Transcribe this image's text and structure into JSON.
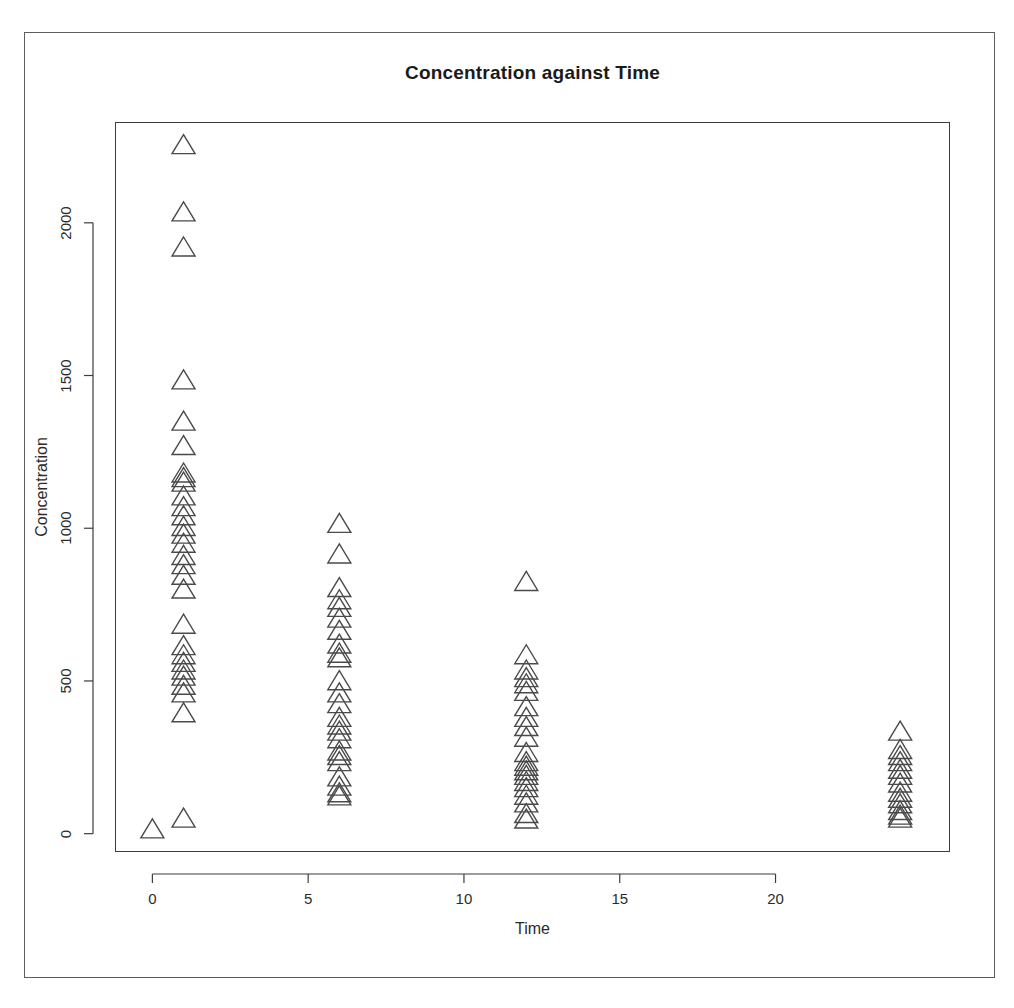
{
  "figure": {
    "title": "Concentration against Time",
    "background_color": "#ffffff",
    "frame_color": "#5d5d5d",
    "axis_color": "#3c3c3c",
    "marker_color": "#4a4a4a"
  },
  "axes": {
    "x_label": "Time",
    "y_label": "Concentration",
    "x_ticks": [
      "0",
      "5",
      "10",
      "15",
      "20"
    ],
    "y_ticks": [
      "0",
      "500",
      "1000",
      "1500",
      "2000"
    ]
  },
  "chart_data": {
    "type": "scatter",
    "title": "Concentration against Time",
    "xlabel": "Time",
    "ylabel": "Concentration",
    "marker": "open-triangle",
    "grid": false,
    "legend": null,
    "xlim": [
      -1.2,
      25.6
    ],
    "ylim": [
      -60,
      2330
    ],
    "x_ticks": [
      0,
      5,
      10,
      15,
      20
    ],
    "y_ticks": [
      0,
      500,
      1000,
      1500,
      2000
    ],
    "points": [
      {
        "x": 0,
        "y": 10
      },
      {
        "x": 1,
        "y": 45
      },
      {
        "x": 1,
        "y": 2250
      },
      {
        "x": 1,
        "y": 2030
      },
      {
        "x": 1,
        "y": 1915
      },
      {
        "x": 1,
        "y": 1480
      },
      {
        "x": 1,
        "y": 1345
      },
      {
        "x": 1,
        "y": 1265
      },
      {
        "x": 1,
        "y": 1175
      },
      {
        "x": 1,
        "y": 1160
      },
      {
        "x": 1,
        "y": 1145
      },
      {
        "x": 1,
        "y": 1100
      },
      {
        "x": 1,
        "y": 1065
      },
      {
        "x": 1,
        "y": 1035
      },
      {
        "x": 1,
        "y": 1000
      },
      {
        "x": 1,
        "y": 975
      },
      {
        "x": 1,
        "y": 945
      },
      {
        "x": 1,
        "y": 905
      },
      {
        "x": 1,
        "y": 875
      },
      {
        "x": 1,
        "y": 840
      },
      {
        "x": 1,
        "y": 795
      },
      {
        "x": 1,
        "y": 680
      },
      {
        "x": 1,
        "y": 610
      },
      {
        "x": 1,
        "y": 580
      },
      {
        "x": 1,
        "y": 555
      },
      {
        "x": 1,
        "y": 530
      },
      {
        "x": 1,
        "y": 510
      },
      {
        "x": 1,
        "y": 480
      },
      {
        "x": 1,
        "y": 455
      },
      {
        "x": 1,
        "y": 390
      },
      {
        "x": 6,
        "y": 1010
      },
      {
        "x": 6,
        "y": 910
      },
      {
        "x": 6,
        "y": 800
      },
      {
        "x": 6,
        "y": 760
      },
      {
        "x": 6,
        "y": 735
      },
      {
        "x": 6,
        "y": 700
      },
      {
        "x": 6,
        "y": 660
      },
      {
        "x": 6,
        "y": 615
      },
      {
        "x": 6,
        "y": 585
      },
      {
        "x": 6,
        "y": 570
      },
      {
        "x": 6,
        "y": 495
      },
      {
        "x": 6,
        "y": 455
      },
      {
        "x": 6,
        "y": 420
      },
      {
        "x": 6,
        "y": 375
      },
      {
        "x": 6,
        "y": 350
      },
      {
        "x": 6,
        "y": 330
      },
      {
        "x": 6,
        "y": 305
      },
      {
        "x": 6,
        "y": 265
      },
      {
        "x": 6,
        "y": 250
      },
      {
        "x": 6,
        "y": 230
      },
      {
        "x": 6,
        "y": 180
      },
      {
        "x": 6,
        "y": 150
      },
      {
        "x": 6,
        "y": 128
      },
      {
        "x": 6,
        "y": 118
      },
      {
        "x": 12,
        "y": 820
      },
      {
        "x": 12,
        "y": 580
      },
      {
        "x": 12,
        "y": 530
      },
      {
        "x": 12,
        "y": 505
      },
      {
        "x": 12,
        "y": 485
      },
      {
        "x": 12,
        "y": 460
      },
      {
        "x": 12,
        "y": 410
      },
      {
        "x": 12,
        "y": 375
      },
      {
        "x": 12,
        "y": 345
      },
      {
        "x": 12,
        "y": 310
      },
      {
        "x": 12,
        "y": 260
      },
      {
        "x": 12,
        "y": 230
      },
      {
        "x": 12,
        "y": 215
      },
      {
        "x": 12,
        "y": 200
      },
      {
        "x": 12,
        "y": 185
      },
      {
        "x": 12,
        "y": 165
      },
      {
        "x": 12,
        "y": 145
      },
      {
        "x": 12,
        "y": 120
      },
      {
        "x": 12,
        "y": 95
      },
      {
        "x": 12,
        "y": 60
      },
      {
        "x": 12,
        "y": 42
      },
      {
        "x": 24,
        "y": 330
      },
      {
        "x": 24,
        "y": 270
      },
      {
        "x": 24,
        "y": 250
      },
      {
        "x": 24,
        "y": 230
      },
      {
        "x": 24,
        "y": 205
      },
      {
        "x": 24,
        "y": 185
      },
      {
        "x": 24,
        "y": 160
      },
      {
        "x": 24,
        "y": 130
      },
      {
        "x": 24,
        "y": 110
      },
      {
        "x": 24,
        "y": 92
      },
      {
        "x": 24,
        "y": 70
      },
      {
        "x": 24,
        "y": 55
      },
      {
        "x": 24,
        "y": 45
      }
    ]
  }
}
